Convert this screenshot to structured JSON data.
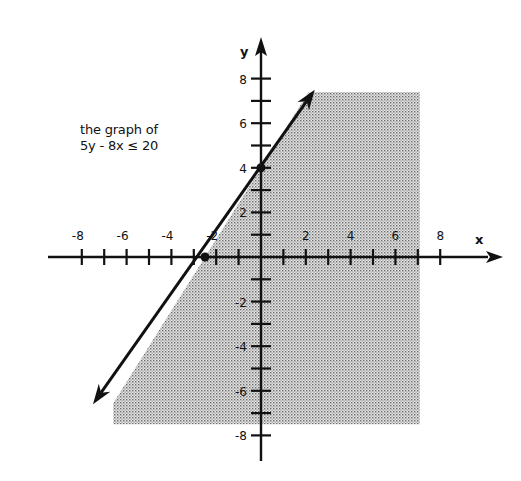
{
  "chart_data": {
    "type": "line",
    "title": "the graph of 5y - 8x ≤ 20",
    "annotation": {
      "line1": "the graph of",
      "line2": "5y - 8x ≤ 20"
    },
    "xlabel": "x",
    "ylabel": "y",
    "xlim": [
      -8.5,
      10
    ],
    "ylim": [
      -9,
      9.5
    ],
    "x_ticks": [
      -8,
      -7,
      -6,
      -5,
      -4,
      -3,
      -2,
      -1,
      1,
      2,
      3,
      4,
      5,
      6,
      7,
      8
    ],
    "x_tick_labels": [
      "-8",
      "-6",
      "-4",
      "-2",
      "2",
      "4",
      "6",
      "8"
    ],
    "x_tick_label_values": [
      -8,
      -6,
      -4,
      -2,
      2,
      4,
      6,
      8
    ],
    "y_ticks": [
      -8,
      -7,
      -6,
      -5,
      -4,
      -3,
      -2,
      -1,
      1,
      2,
      3,
      4,
      5,
      6,
      7,
      8
    ],
    "y_tick_labels": [
      "8",
      "6",
      "4",
      "2",
      "-2",
      "-4",
      "-6",
      "-8"
    ],
    "y_tick_label_values": [
      8,
      6,
      4,
      2,
      -2,
      -4,
      -6,
      -8
    ],
    "grid": false,
    "series": [
      {
        "name": "boundary line 5y - 8x = 20",
        "equation": "y = 1.6x + 4",
        "x": [
          -7.5,
          2.4
        ],
        "y": [
          -6.6,
          7.5
        ],
        "style": "solid with arrows both ends"
      }
    ],
    "points": [
      {
        "x": -2.5,
        "y": 0,
        "label": "x-intercept"
      },
      {
        "x": 0,
        "y": 4,
        "label": "y-intercept"
      }
    ],
    "shaded_region": {
      "description": "half-plane below/right of line (5y - 8x ≤ 20)",
      "x_range": [
        -6.6,
        7.1
      ],
      "y_range": [
        -7.5,
        7.4
      ],
      "pattern": "stippled gray"
    }
  },
  "colors": {
    "ink": "#111111",
    "shade": "#9a9a9a",
    "background": "#ffffff"
  }
}
